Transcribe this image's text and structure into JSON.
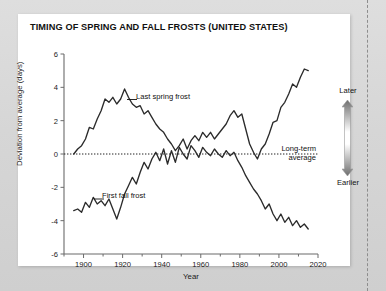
{
  "page": {
    "background_color": "#d6d6d6",
    "card_color": "#ffffff",
    "cut_line": "dashed-vertical-rule"
  },
  "chart_title": "TIMING OF SPRING AND FALL FROSTS (UNITED STATES)",
  "axes": {
    "x_title": "Year",
    "y_title": "Deviation from average (days)",
    "x_ticks": [
      "1900",
      "1920",
      "1940",
      "1960",
      "1980",
      "2000",
      "2020"
    ],
    "y_ticks": [
      "6",
      "4",
      "2",
      "0",
      "-2",
      "-4",
      "-6"
    ]
  },
  "annotations": {
    "spring": "Last spring frost",
    "fall": "First fall frost",
    "average_line_1": "Long-term",
    "average_line_2": "average"
  },
  "legend": {
    "top_label": "Later",
    "bottom_label": "Earlier",
    "gradient_dark": "#6e6e6e",
    "gradient_light": "#ffffff"
  },
  "chart_data": {
    "type": "line",
    "title": "TIMING OF SPRING AND FALL FROSTS (UNITED STATES)",
    "xlabel": "Year",
    "ylabel": "Deviation from average (days)",
    "xlim": [
      1890,
      2020
    ],
    "ylim": [
      -6,
      6
    ],
    "xticks": [
      1900,
      1920,
      1940,
      1960,
      1980,
      2000,
      2020
    ],
    "yticks": [
      -6,
      -4,
      -2,
      0,
      2,
      4,
      6
    ],
    "grid": false,
    "legend_position": "in-plot annotations",
    "reference_line": {
      "y": 0,
      "style": "dotted",
      "label": "Long-term average"
    },
    "series": [
      {
        "name": "Last spring frost",
        "color": "#2b2b2b",
        "x": [
          1895,
          1897,
          1899,
          1901,
          1903,
          1905,
          1907,
          1909,
          1911,
          1913,
          1915,
          1917,
          1919,
          1921,
          1923,
          1925,
          1927,
          1929,
          1931,
          1933,
          1935,
          1937,
          1939,
          1941,
          1943,
          1945,
          1947,
          1949,
          1951,
          1953,
          1955,
          1957,
          1959,
          1961,
          1963,
          1965,
          1967,
          1969,
          1971,
          1973,
          1975,
          1977,
          1979,
          1981,
          1983,
          1985,
          1987,
          1989,
          1991,
          1993,
          1995,
          1997,
          1999,
          2001,
          2003,
          2005,
          2007,
          2009,
          2011,
          2013,
          2015
        ],
        "y": [
          0.0,
          0.3,
          0.5,
          0.9,
          1.6,
          1.5,
          2.1,
          2.6,
          3.3,
          3.1,
          3.4,
          3.0,
          3.3,
          3.9,
          3.4,
          3.0,
          2.8,
          2.9,
          2.4,
          2.6,
          2.2,
          1.8,
          1.5,
          1.3,
          0.9,
          0.6,
          0.2,
          0.5,
          0.9,
          0.3,
          0.8,
          1.1,
          0.8,
          1.3,
          1.0,
          1.3,
          0.9,
          1.2,
          1.5,
          1.8,
          2.3,
          2.6,
          2.2,
          2.4,
          1.5,
          0.6,
          0.1,
          -0.3,
          0.3,
          0.6,
          1.2,
          1.9,
          2.0,
          2.8,
          3.1,
          3.6,
          4.2,
          4.0,
          4.6,
          5.1,
          5.0
        ]
      },
      {
        "name": "First fall frost",
        "color": "#2b2b2b",
        "x": [
          1895,
          1897,
          1899,
          1901,
          1903,
          1905,
          1907,
          1909,
          1911,
          1913,
          1915,
          1917,
          1919,
          1921,
          1923,
          1925,
          1927,
          1929,
          1931,
          1933,
          1935,
          1937,
          1939,
          1941,
          1943,
          1945,
          1947,
          1949,
          1951,
          1953,
          1955,
          1957,
          1959,
          1961,
          1963,
          1965,
          1967,
          1969,
          1971,
          1973,
          1975,
          1977,
          1979,
          1981,
          1983,
          1985,
          1987,
          1989,
          1991,
          1993,
          1995,
          1997,
          1999,
          2001,
          2003,
          2005,
          2007,
          2009,
          2011,
          2013,
          2015
        ],
        "y": [
          -3.4,
          -3.3,
          -3.5,
          -2.9,
          -3.2,
          -2.6,
          -3.0,
          -2.8,
          -3.1,
          -2.7,
          -3.3,
          -3.9,
          -3.2,
          -2.4,
          -1.9,
          -1.4,
          -1.8,
          -1.1,
          -0.5,
          -0.9,
          -0.3,
          0.1,
          -0.4,
          0.3,
          -0.6,
          0.2,
          -0.5,
          0.4,
          0.0,
          -0.3,
          0.5,
          0.2,
          -0.2,
          0.4,
          0.1,
          -0.1,
          0.3,
          0.0,
          -0.2,
          0.2,
          -0.1,
          0.1,
          -0.4,
          -0.8,
          -1.3,
          -1.7,
          -2.1,
          -2.4,
          -2.8,
          -3.3,
          -3.0,
          -3.6,
          -4.0,
          -3.6,
          -4.1,
          -3.8,
          -4.3,
          -4.0,
          -4.4,
          -4.2,
          -4.5
        ]
      }
    ]
  }
}
